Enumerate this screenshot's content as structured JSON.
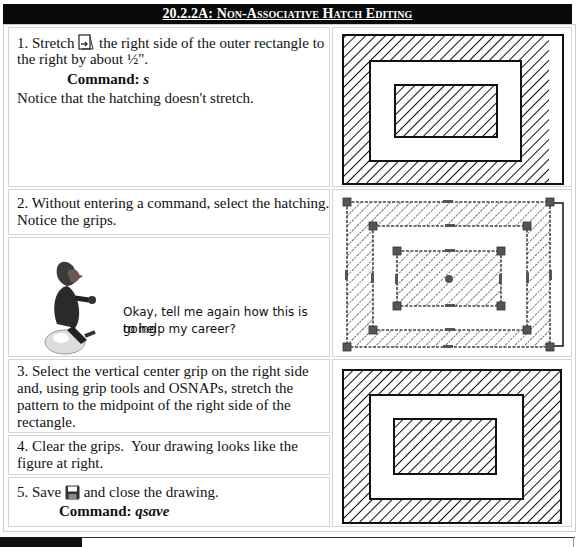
{
  "header": {
    "title": "20.2.2A: Non-Associative Hatch Editing"
  },
  "steps": [
    {
      "number": "1.",
      "text_before_icon": "Stretch",
      "icon": "stretch-icon",
      "text_after_icon": "the right side of the outer rectangle to",
      "text_line2": "the right by about ½\".",
      "command_label": "Command:",
      "command_value": "s",
      "note": "Notice that the hatching doesn't stretch."
    },
    {
      "number": "2.",
      "text_line1": "Without entering a command, select the hatching.",
      "text_line2": "Notice the grips."
    },
    {
      "number": "3.",
      "lines": [
        "Select the vertical center grip on the right side",
        "and, using grip tools and OSNAPs, stretch the",
        "pattern to the midpoint of the right side of the",
        "rectangle."
      ]
    },
    {
      "number": "4.",
      "lines": [
        "Clear the grips.  Your drawing looks like the",
        "figure at right."
      ]
    },
    {
      "number": "5.",
      "text_before_icon": "Save",
      "icon": "save-icon",
      "text_after_icon": "and close the drawing.",
      "command_label": "Command:",
      "command_value": "qsave"
    }
  ],
  "callout": {
    "line1": "Okay, tell me again how this is going",
    "line2": "to help my career?"
  },
  "figures": [
    {
      "name": "stretched-rectangle-figure",
      "state": "outer rectangle stretched, hatch not stretched"
    },
    {
      "name": "selected-hatch-grips-figure",
      "state": "hatch selected with grips"
    },
    {
      "name": "final-hatch-figure",
      "state": "hatch stretched to match"
    }
  ],
  "colors": {
    "banner_bg": "#0a0a0a",
    "banner_text": "#ffffff",
    "grip": "#555555"
  }
}
